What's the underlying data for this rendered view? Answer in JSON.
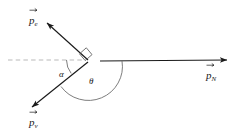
{
  "figure": {
    "name": "momentum-vector-diagram",
    "type": "vector-diagram",
    "width": 235,
    "height": 140,
    "background": "#ffffff"
  },
  "colors": {
    "vector_stroke": "#1a1a1a",
    "dashed_reference": "#b9b9b9",
    "arc_stroke": "#6e6e6e",
    "right_angle_stroke": "#6e6e6e",
    "label_text": "#1a1a1a"
  },
  "vertex": {
    "x": 88,
    "y": 60
  },
  "vectors": [
    {
      "id": "p-electron",
      "symbol": "p",
      "subscript": "e",
      "label": "p⃗e",
      "description": "electron momentum vector, points up and to the left",
      "from": {
        "x": 88,
        "y": 60
      },
      "to": {
        "x": 46,
        "y": 22
      },
      "arrowhead": true,
      "style": "solid"
    },
    {
      "id": "p-neutrino",
      "symbol": "p",
      "subscript": "ν",
      "label": "p⃗ν",
      "description": "neutrino momentum vector, points down and to the left",
      "from": {
        "x": 88,
        "y": 62
      },
      "to": {
        "x": 30,
        "y": 109
      },
      "arrowhead": true,
      "style": "solid"
    },
    {
      "id": "p-nucleus",
      "symbol": "p",
      "subscript": "N",
      "label": "p⃗N",
      "description": "recoil nucleus momentum vector, points right horizontally",
      "from": {
        "x": 100,
        "y": 61
      },
      "to": {
        "x": 229,
        "y": 60
      },
      "arrowhead": true,
      "style": "solid"
    }
  ],
  "reference_line": {
    "id": "horizontal-dashed-reference",
    "description": "dashed horizontal reference axis to the left of the vertex",
    "from": {
      "x": 8,
      "y": 60
    },
    "to": {
      "x": 86,
      "y": 60
    },
    "style": "dashed"
  },
  "angles": [
    {
      "id": "angle-alpha",
      "symbol": "α",
      "description": "angle between dashed horizontal reference and neutrino momentum",
      "label_x": 62,
      "label_y": 74,
      "arc_radius": 22
    },
    {
      "id": "angle-theta",
      "symbol": "θ",
      "description": "angle between neutrino momentum and nucleus momentum",
      "label_x": 92,
      "label_y": 82,
      "arc_radius": 34
    }
  ],
  "right_angle_marker": {
    "id": "right-angle-marker",
    "description": "square marker indicating 90 degrees between electron and neutrino momenta",
    "at_vertex": true,
    "size": 9
  },
  "labels": {
    "p_electron": "p",
    "p_electron_sub": "e",
    "p_neutrino": "p",
    "p_neutrino_sub": "ν",
    "p_nucleus": "p",
    "p_nucleus_sub": "N",
    "alpha": "α",
    "theta": "θ"
  }
}
